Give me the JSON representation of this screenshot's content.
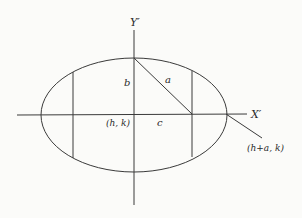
{
  "diagram": {
    "type": "ellipse-geometry",
    "labels": {
      "y_axis": "Y′",
      "x_axis": "X′",
      "semi_minor": "b",
      "focal_segment": "a",
      "center": "(h, k)",
      "focal_distance": "c",
      "vertex": "(h+a, k)"
    },
    "colors": {
      "stroke": "#3a3a3a",
      "text": "#2a2a2a",
      "background": "#fbfbf9"
    }
  }
}
